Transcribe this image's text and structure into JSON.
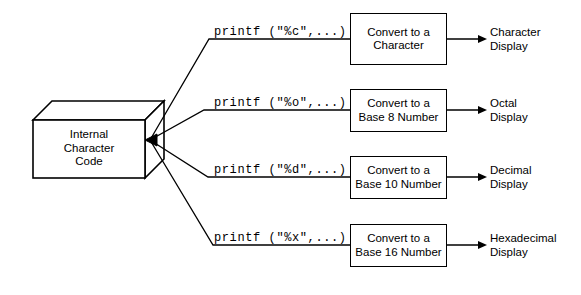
{
  "diagram": {
    "source": {
      "label": "Internal\nCharacter\nCode",
      "shape": "3d-box"
    },
    "line_color": "#000000",
    "background_color": "#ffffff",
    "rows": [
      {
        "printf": "printf (\"%c\",...)",
        "convert": "Convert to a\nCharacter",
        "display": "Character\nDisplay"
      },
      {
        "printf": "printf (\"%o\",...)",
        "convert": "Convert to a\nBase 8 Number",
        "display": "Octal\nDisplay"
      },
      {
        "printf": "printf (\"%d\",...)",
        "convert": "Convert to a\nBase 10 Number",
        "display": "Decimal\nDisplay"
      },
      {
        "printf": "printf (\"%x\",...)",
        "convert": "Convert to a\nBase 16 Number",
        "display": "Hexadecimal\nDisplay"
      }
    ]
  }
}
